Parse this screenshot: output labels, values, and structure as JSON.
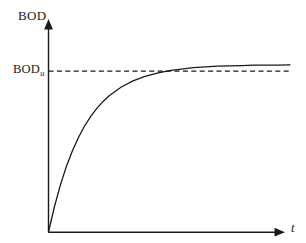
{
  "figure": {
    "name": "bod-exponential-curve",
    "background_color": "#ffffff",
    "ink_color": "#1a1a1a"
  },
  "labels": {
    "y_axis_title": "BOD",
    "asymptote_base": "BOD",
    "asymptote_subscript": "u",
    "x_axis_title": "t"
  },
  "chart_data": {
    "type": "line",
    "title": "",
    "xlabel": "t",
    "ylabel": "BOD",
    "grid": false,
    "legend": false,
    "axis_style": "arrow-tipped",
    "xlim": [
      0,
      1
    ],
    "ylim": [
      0,
      1.15
    ],
    "tick_labels": {
      "x": [],
      "y": [
        "BOD_u"
      ]
    },
    "annotations": [
      {
        "name": "ultimate-bod-asymptote",
        "text": "BOD_u",
        "type": "horizontal-dashed-line",
        "y_value": 1.0
      }
    ],
    "series": [
      {
        "name": "BOD exerted",
        "equation": "BOD = BOD_u (1 - e^(-k t))",
        "style": "solid",
        "color": "#1a1a1a",
        "x": [
          0.0,
          0.025,
          0.05,
          0.075,
          0.1,
          0.125,
          0.15,
          0.175,
          0.2,
          0.225,
          0.25,
          0.3,
          0.35,
          0.4,
          0.45,
          0.5,
          0.55,
          0.6,
          0.65,
          0.7,
          0.75,
          0.8,
          0.85,
          0.9,
          0.95,
          1.0
        ],
        "values": [
          0.0,
          0.154,
          0.285,
          0.396,
          0.489,
          0.568,
          0.635,
          0.691,
          0.739,
          0.779,
          0.813,
          0.865,
          0.903,
          0.93,
          0.95,
          0.964,
          0.974,
          0.982,
          0.987,
          0.991,
          0.993,
          0.995,
          0.997,
          0.998,
          0.998,
          0.999
        ]
      },
      {
        "name": "Ultimate BOD asymptote",
        "style": "dashed",
        "color": "#1a1a1a",
        "x": [
          0.0,
          1.0
        ],
        "values": [
          1.0,
          1.0
        ]
      }
    ]
  }
}
